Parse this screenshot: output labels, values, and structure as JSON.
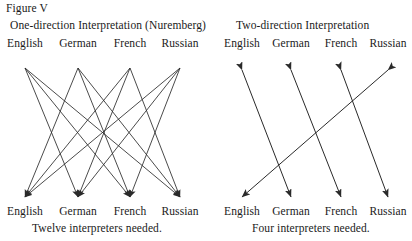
{
  "figure": {
    "label": "Figure V"
  },
  "panels": [
    {
      "id": "one-direction",
      "title": "One-direction Interpretation (Nuremberg)",
      "caption": "Twelve interpreters needed.",
      "top_labels": [
        "English",
        "German",
        "French",
        "Russian"
      ],
      "bottom_labels": [
        "English",
        "German",
        "French",
        "Russian"
      ],
      "arrow_style": "single-headed",
      "arrow_count": 12
    },
    {
      "id": "two-direction",
      "title": "Two-direction Interpretation",
      "caption": "Four interpreters needed.",
      "top_labels": [
        "English",
        "German",
        "French",
        "Russian"
      ],
      "bottom_labels": [
        "English",
        "German",
        "French",
        "Russian"
      ],
      "arrow_style": "double-headed",
      "arrow_count": 4
    }
  ],
  "diagram_data": {
    "type": "diagram",
    "left_panel": {
      "top_nodes_x": [
        25,
        78,
        130,
        180
      ],
      "bottom_nodes_x": [
        25,
        78,
        130,
        180
      ],
      "top_y": 68,
      "bottom_y": 197,
      "edges": [
        {
          "from": 0,
          "to": 1
        },
        {
          "from": 0,
          "to": 2
        },
        {
          "from": 0,
          "to": 3
        },
        {
          "from": 1,
          "to": 0
        },
        {
          "from": 1,
          "to": 2
        },
        {
          "from": 1,
          "to": 3
        },
        {
          "from": 2,
          "to": 0
        },
        {
          "from": 2,
          "to": 1
        },
        {
          "from": 2,
          "to": 3
        },
        {
          "from": 3,
          "to": 0
        },
        {
          "from": 3,
          "to": 1
        },
        {
          "from": 3,
          "to": 2
        }
      ]
    },
    "right_panel": {
      "nodes_x": [
        242,
        291,
        341,
        388
      ],
      "top_y": 70,
      "bottom_y": 197,
      "edges": [
        {
          "top": 0,
          "bottom": 1
        },
        {
          "top": 1,
          "bottom": 2
        },
        {
          "top": 2,
          "bottom": 3
        },
        {
          "top": 3,
          "bottom": 0
        }
      ]
    }
  },
  "colors": {
    "stroke": "#2a2a2a",
    "text": "#1a1a1a",
    "background": "#ffffff"
  }
}
